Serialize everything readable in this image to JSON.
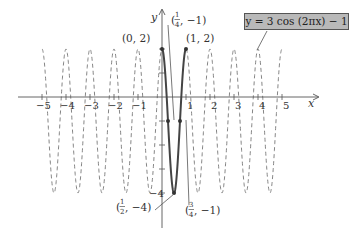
{
  "chart_data": {
    "type": "line",
    "title": "",
    "equation_label": "y = 3 cos (2πx) − 1",
    "function": "y = 3cos(2*pi*x) - 1",
    "xlabel": "x",
    "ylabel": "y",
    "xlim": [
      -5.3,
      5.5
    ],
    "ylim": [
      -4.8,
      2.6
    ],
    "x_ticks": [
      -5,
      -4,
      -3,
      -2,
      -1,
      1,
      2,
      3,
      4,
      5
    ],
    "x_tick_labels": [
      "−5",
      "−4",
      "−3",
      "−2",
      "−1",
      "1",
      "2",
      "3",
      "4",
      "5"
    ],
    "y_tick_labels": [
      "−4"
    ],
    "grid": false,
    "series": [
      {
        "name": "one period (solid)",
        "style": "solid",
        "x_range": [
          0,
          1
        ],
        "key_points": [
          {
            "x": 0,
            "y": 2,
            "label": "(0, 2)"
          },
          {
            "x": 0.25,
            "y": -1,
            "label": "(1/4, −1)"
          },
          {
            "x": 0.5,
            "y": -4,
            "label": "(1/2, −4)"
          },
          {
            "x": 0.75,
            "y": -1,
            "label": "(3/4, −1)"
          },
          {
            "x": 1,
            "y": 2,
            "label": "(1, 2)"
          }
        ]
      },
      {
        "name": "extension (dashed)",
        "style": "dashed",
        "x_range": [
          -5,
          5
        ]
      }
    ],
    "amplitude": 3,
    "period": 1,
    "vertical_shift": -1,
    "max": 2,
    "min": -4
  },
  "labels": {
    "p0": "(0, 2)",
    "p1": "(1, 2)",
    "q1_num": "1",
    "q1_den": "4",
    "q1_y": ", −1)",
    "half_num": "1",
    "half_den": "2",
    "half_y": ", −4)",
    "q3_num": "3",
    "q3_den": "4",
    "q3_y": ", −1)",
    "open_paren": "("
  }
}
